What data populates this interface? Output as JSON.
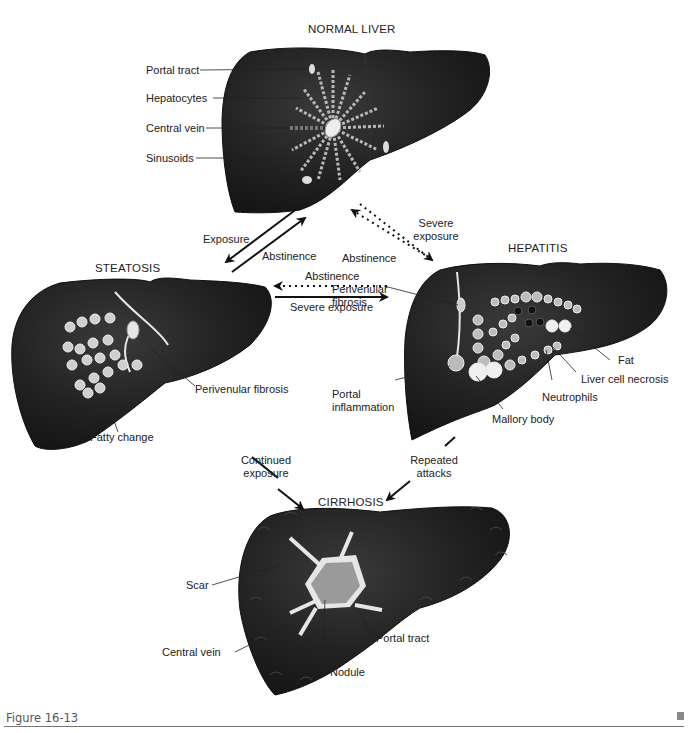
{
  "figure": {
    "caption": "Figure 16-13",
    "colors": {
      "liver": "#1f1f1f",
      "liver_highlight": "#3a3a3a",
      "cell_fill": "#b8b8b8",
      "cell_outline": "#e8e8e8",
      "scar": "#e6e6e6",
      "nodule": "#9a9a9a",
      "text": "#222222"
    }
  },
  "stages": {
    "normal": {
      "title": "NORMAL LIVER",
      "labels": [
        "Portal tract",
        "Hepatocytes",
        "Central vein",
        "Sinusoids"
      ]
    },
    "steatosis": {
      "title": "STEATOSIS",
      "labels": [
        "Perivenular fibrosis",
        "Fatty change"
      ]
    },
    "hepatitis": {
      "title": "HEPATITIS",
      "labels": [
        "Perivenular fibrosis",
        "Portal inflammation",
        "Mallory body",
        "Neutrophils",
        "Liver cell necrosis",
        "Fat"
      ]
    },
    "cirrhosis": {
      "title": "CIRRHOSIS",
      "labels": [
        "Scar",
        "Central vein",
        "Nodule",
        "Portal tract"
      ]
    }
  },
  "transitions": {
    "normal_to_steatosis": "Exposure",
    "steatosis_to_normal": "Abstinence",
    "normal_to_hepatitis": "Severe exposure",
    "hepatitis_to_normal": "Abstinence",
    "hepatitis_to_steatosis": "Abstinence",
    "steatosis_to_hepatitis": "Severe exposure",
    "steatosis_to_cirrhosis": "Continued exposure",
    "hepatitis_to_cirrhosis": "Repeated attacks"
  }
}
